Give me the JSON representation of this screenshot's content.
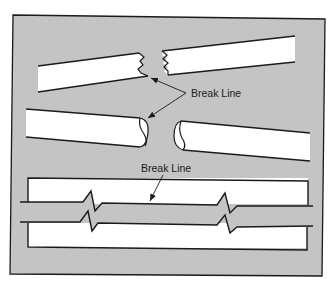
{
  "figure": {
    "type": "break-line-illustration",
    "colors": {
      "panel_fill": "#c4c4c4",
      "panel_border": "#1a1a1a",
      "part_fill": "#ffffff",
      "stroke": "#1a1a1a"
    },
    "labels": {
      "upper_label": "Break Line",
      "lower_label": "Break Line"
    },
    "examples": [
      {
        "name": "rectangular-bar",
        "break_style": "jagged freehand break"
      },
      {
        "name": "round-rod",
        "break_style": "S-break (cylindrical)"
      },
      {
        "name": "long-break",
        "break_style": "ruled line with zig-zag"
      }
    ]
  }
}
